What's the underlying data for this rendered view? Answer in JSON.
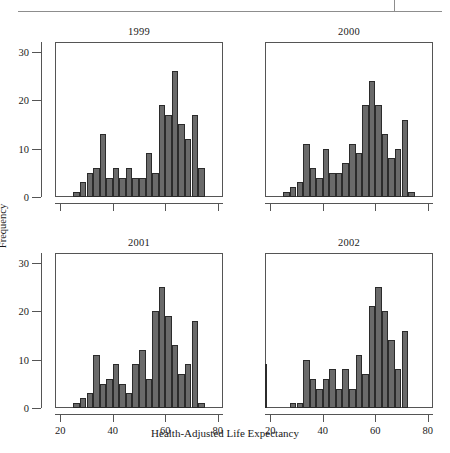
{
  "figure": {
    "ylabel": "Frequency",
    "xlabel": "Health-Adjusted Life Expectancy",
    "footer": "",
    "bar_color": "#6a6a6a",
    "bar_edge_color": "#2b2b2b",
    "axis_color": "#555555"
  },
  "axes": {
    "xlim": [
      18,
      82
    ],
    "ylim": [
      0,
      32
    ],
    "xticks": [
      20,
      40,
      60,
      80
    ],
    "yticks": [
      0,
      10,
      20,
      30
    ],
    "xtick_labels": [
      "20",
      "40",
      "60",
      "80"
    ],
    "ytick_labels": [
      "0",
      "10",
      "20",
      "30"
    ],
    "grid": false
  },
  "chart_data": {
    "type": "bar",
    "title": "",
    "subtitle": "",
    "xlabel": "Health-Adjusted Life Expectancy",
    "ylabel": "Frequency",
    "xlim": [
      18,
      82
    ],
    "ylim": [
      0,
      32
    ],
    "grid": false,
    "legend": null,
    "bin_width": 2.5,
    "panels": [
      {
        "label": "1999",
        "bin_starts": [
          25.0,
          27.5,
          30.0,
          32.5,
          35.0,
          37.5,
          40.0,
          42.5,
          45.0,
          47.5,
          50.0,
          52.5,
          55.0,
          57.5,
          60.0,
          62.5,
          65.0,
          67.5,
          70.0,
          72.5
        ],
        "values": [
          1,
          3,
          5,
          6,
          13,
          4,
          6,
          4,
          6,
          4,
          4,
          9,
          5,
          19,
          17,
          26,
          15,
          12,
          17,
          6
        ]
      },
      {
        "label": "2000",
        "bin_starts": [
          25.0,
          27.5,
          30.0,
          32.5,
          35.0,
          37.5,
          40.0,
          42.5,
          45.0,
          47.5,
          50.0,
          52.5,
          55.0,
          57.5,
          60.0,
          62.5,
          65.0,
          67.5,
          70.0,
          72.5
        ],
        "values": [
          1,
          2,
          3,
          11,
          6,
          4,
          10,
          5,
          5,
          7,
          11,
          9,
          19,
          24,
          19,
          13,
          8,
          10,
          16,
          1
        ]
      },
      {
        "label": "2001",
        "bin_starts": [
          25.0,
          27.5,
          30.0,
          32.5,
          35.0,
          37.5,
          40.0,
          42.5,
          45.0,
          47.5,
          50.0,
          52.5,
          55.0,
          57.5,
          60.0,
          62.5,
          65.0,
          67.5,
          70.0,
          72.5
        ],
        "values": [
          1,
          2,
          3,
          11,
          5,
          6,
          9,
          5,
          3,
          9,
          12,
          6,
          20,
          25,
          19,
          13,
          7,
          9,
          18,
          1
        ]
      },
      {
        "label": "2002",
        "bin_starts": [
          27.5,
          30.0,
          32.5,
          35.0,
          37.5,
          40.0,
          42.5,
          45.0,
          47.5,
          50.0,
          52.5,
          55.0,
          57.5,
          60.0,
          62.5,
          65.0,
          67.5,
          70.0
        ],
        "values": [
          1,
          1,
          10,
          6,
          4,
          6,
          8,
          4,
          8,
          4,
          11,
          7,
          21,
          25,
          20,
          14,
          8,
          16,
          9
        ]
      }
    ]
  }
}
